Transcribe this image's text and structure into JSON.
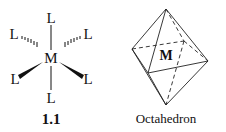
{
  "structure": {
    "metal": "M",
    "ligands": {
      "top": "L",
      "bottom": "L",
      "upper_left": "L",
      "upper_right": "L",
      "lower_left": "L",
      "lower_right": "L"
    },
    "caption": "1.1"
  },
  "octahedron": {
    "center_label": "M",
    "caption": "Octahedron"
  }
}
